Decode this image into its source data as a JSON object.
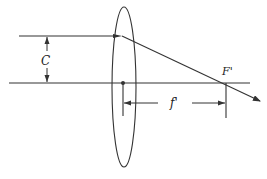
{
  "diagram": {
    "type": "thin-lens focal length diagram",
    "labels": {
      "aperture_height": "C",
      "focal_point": "F'",
      "focal_length": "f'"
    },
    "colors": {
      "line": "#333333",
      "background": "#ffffff"
    },
    "elements": {
      "lens": "converging lens (ellipse)",
      "optical_axis": "horizontal axis",
      "incident_ray": "ray parallel to axis at height C",
      "refracted_ray": "ray through focal point F'",
      "height_dimension": "dimension C",
      "focal_dimension": "dimension f'"
    }
  }
}
